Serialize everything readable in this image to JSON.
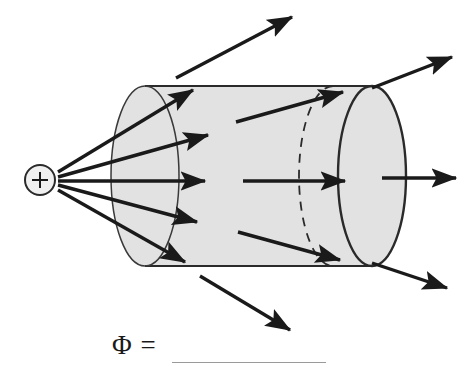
{
  "figure": {
    "background_color": "#ffffff",
    "ink_color": "#1a1a1a",
    "cylinder_fill": "#e2e2e2",
    "cylinder_stroke": "#2a2a2a",
    "blank_line_color": "#9a9a9a"
  },
  "charge": {
    "symbol": "+",
    "label": "point-charge",
    "cx": 40,
    "cy": 180,
    "r": 15
  },
  "cylinder": {
    "left_cap_cx": 145,
    "right_cap_cx": 372,
    "hidden_rim_cx": 333,
    "cy": 176,
    "rx": 34,
    "ry": 90,
    "top_y": 86,
    "bottom_y": 266
  },
  "field_lines": [
    {
      "name": "ray-up-steep",
      "x1": 58,
      "y1": 172,
      "x2": 193,
      "y2": 90
    },
    {
      "name": "ray-up-shallow",
      "x1": 58,
      "y1": 177,
      "x2": 208,
      "y2": 135
    },
    {
      "name": "ray-horizontal",
      "x1": 58,
      "y1": 181,
      "x2": 205,
      "y2": 181
    },
    {
      "name": "ray-down-shallow",
      "x1": 58,
      "y1": 185,
      "x2": 197,
      "y2": 222
    },
    {
      "name": "ray-down-steep",
      "x1": 58,
      "y1": 190,
      "x2": 185,
      "y2": 262
    }
  ],
  "interior_arrows": [
    {
      "name": "interior-arrow-upper",
      "x1": 236,
      "y1": 122,
      "x2": 343,
      "y2": 92
    },
    {
      "name": "interior-arrow-middle",
      "x1": 243,
      "y1": 181,
      "x2": 345,
      "y2": 181
    },
    {
      "name": "interior-arrow-lower",
      "x1": 238,
      "y1": 232,
      "x2": 340,
      "y2": 260
    }
  ],
  "exit_arrows": [
    {
      "name": "exit-arrow-top",
      "x1": 176,
      "y1": 78,
      "x2": 292,
      "y2": 17
    },
    {
      "name": "exit-arrow-upper-right",
      "x1": 372,
      "y1": 88,
      "x2": 452,
      "y2": 57
    },
    {
      "name": "exit-arrow-right",
      "x1": 382,
      "y1": 178,
      "x2": 456,
      "y2": 178
    },
    {
      "name": "exit-arrow-lower-right",
      "x1": 372,
      "y1": 263,
      "x2": 447,
      "y2": 288
    },
    {
      "name": "exit-arrow-bottom",
      "x1": 200,
      "y1": 276,
      "x2": 290,
      "y2": 330
    }
  ],
  "equation": {
    "text": "Φ =",
    "blank_label": "answer-blank"
  }
}
